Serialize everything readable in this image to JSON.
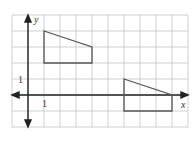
{
  "figure": {
    "type": "coordinate-grid",
    "grid": {
      "x_min": -1,
      "x_max": 10,
      "y_min": -2,
      "y_max": 5,
      "unit_px": 16,
      "origin_px": [
        28,
        95
      ],
      "line_color": "#cfcfcf"
    },
    "axes": {
      "x_label": "x",
      "y_label": "y",
      "x_tick_label": "1",
      "y_tick_label": "1",
      "color": "#222222"
    },
    "shapes": [
      {
        "name": "quadrilateral-original",
        "vertices": [
          [
            1,
            4
          ],
          [
            4,
            3
          ],
          [
            4,
            2
          ],
          [
            1,
            2
          ]
        ],
        "stroke": "#555555"
      },
      {
        "name": "quadrilateral-image",
        "vertices": [
          [
            6,
            1
          ],
          [
            9,
            0
          ],
          [
            9,
            -1
          ],
          [
            6,
            -1
          ]
        ],
        "stroke": "#555555"
      }
    ]
  }
}
